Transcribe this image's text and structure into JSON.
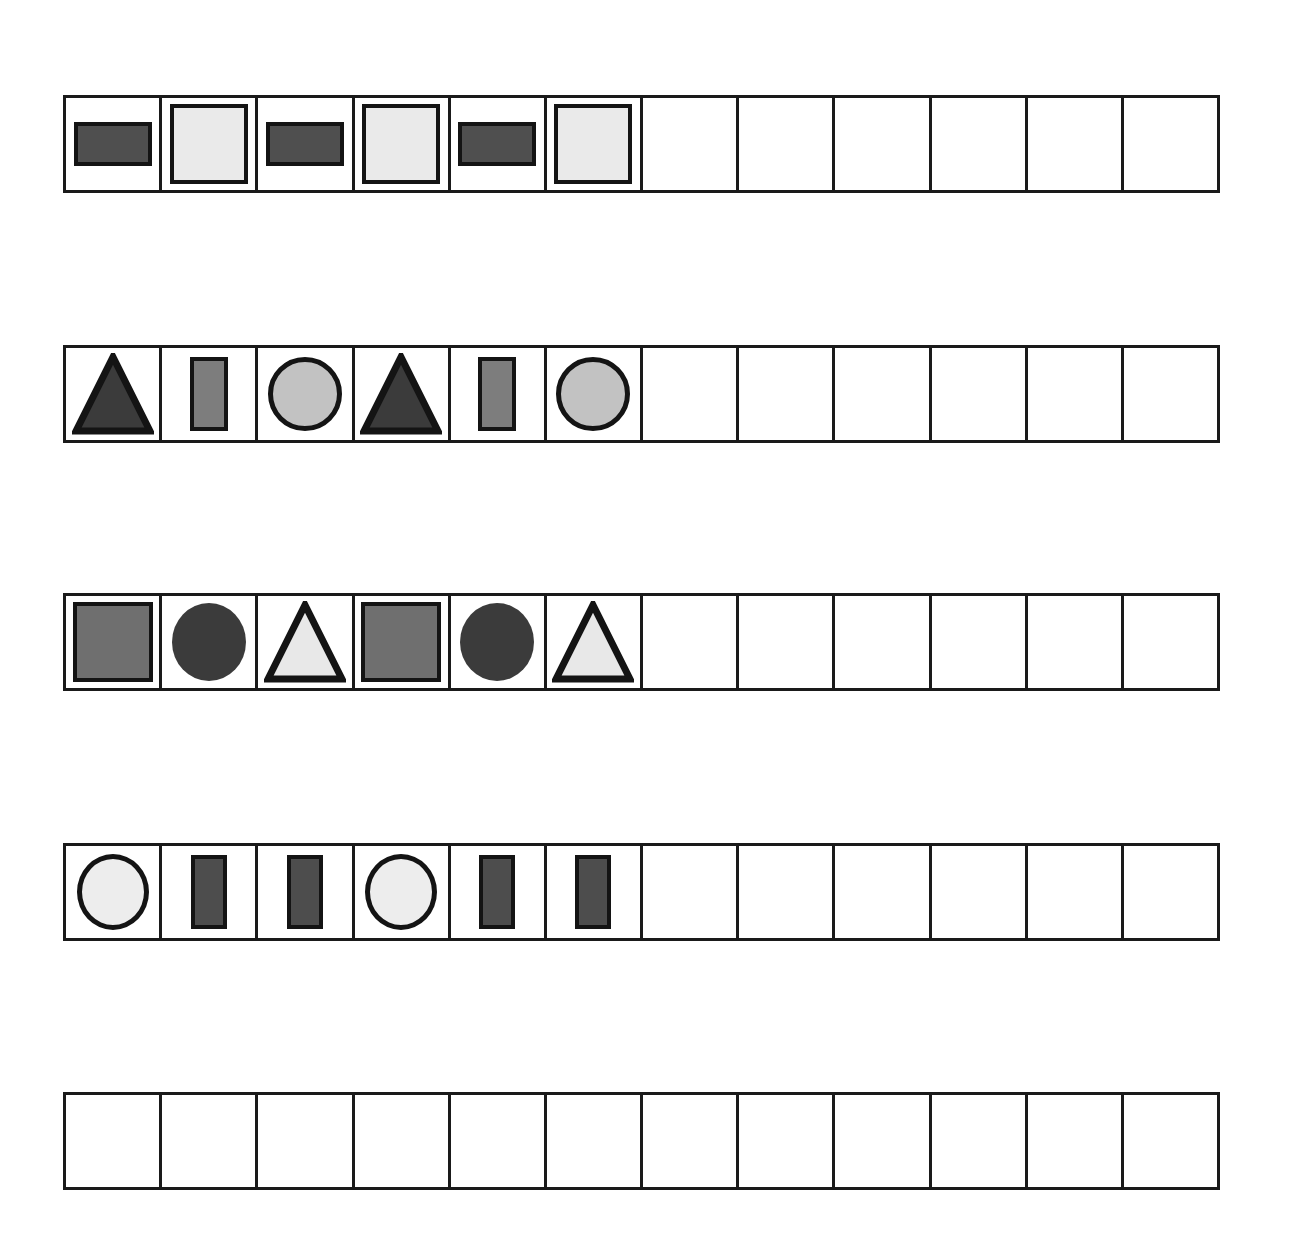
{
  "page": {
    "background_color": "#ffffff",
    "line_color": "#1a1a1a",
    "width": 1289,
    "height": 1240
  },
  "grid": {
    "rows": 5,
    "columns_per_row": 12,
    "row_left": 63,
    "row_width": 1157,
    "row_height": 98,
    "cell_width": 96,
    "border_width_px": 3
  },
  "palette": {
    "outline": "#141414",
    "dark_gray": "#4f4f4f",
    "darker_gray": "#3b3b3b",
    "medium_gray": "#7d7d7d",
    "mid_gray": "#6f6f6f",
    "light_gray": "#c2c2c2",
    "very_light_gray": "#eaeaea",
    "near_white": "#ededed",
    "pale_gray": "#e8e8e8"
  },
  "rows": [
    {
      "id": "row-1",
      "top": 95,
      "pattern_period": 2,
      "filled_cells": 6,
      "empty_cells": 6,
      "cells": [
        {
          "index": 1,
          "shape": "rectangle",
          "fill": "#4f4f4f",
          "orientation": "horizontal",
          "label": "dark-gray-wide-rectangle"
        },
        {
          "index": 2,
          "shape": "square",
          "fill": "#eaeaea",
          "orientation": "upright",
          "label": "light-gray-square"
        },
        {
          "index": 3,
          "shape": "rectangle",
          "fill": "#4f4f4f",
          "orientation": "horizontal",
          "label": "dark-gray-wide-rectangle"
        },
        {
          "index": 4,
          "shape": "square",
          "fill": "#eaeaea",
          "orientation": "upright",
          "label": "light-gray-square"
        },
        {
          "index": 5,
          "shape": "rectangle",
          "fill": "#4f4f4f",
          "orientation": "horizontal",
          "label": "dark-gray-wide-rectangle"
        },
        {
          "index": 6,
          "shape": "square",
          "fill": "#eaeaea",
          "orientation": "upright",
          "label": "light-gray-square"
        },
        {
          "index": 7,
          "shape": "empty",
          "fill": "#ffffff",
          "label": "empty-cell"
        },
        {
          "index": 8,
          "shape": "empty",
          "fill": "#ffffff",
          "label": "empty-cell"
        },
        {
          "index": 9,
          "shape": "empty",
          "fill": "#ffffff",
          "label": "empty-cell"
        },
        {
          "index": 10,
          "shape": "empty",
          "fill": "#ffffff",
          "label": "empty-cell"
        },
        {
          "index": 11,
          "shape": "empty",
          "fill": "#ffffff",
          "label": "empty-cell"
        },
        {
          "index": 12,
          "shape": "empty",
          "fill": "#ffffff",
          "label": "empty-cell"
        }
      ]
    },
    {
      "id": "row-2",
      "top": 345,
      "pattern_period": 3,
      "filled_cells": 6,
      "empty_cells": 6,
      "cells": [
        {
          "index": 1,
          "shape": "triangle",
          "fill": "#3b3b3b",
          "orientation": "upright",
          "label": "dark-gray-triangle"
        },
        {
          "index": 2,
          "shape": "rectangle",
          "fill": "#7d7d7d",
          "orientation": "vertical",
          "label": "medium-gray-tall-rectangle"
        },
        {
          "index": 3,
          "shape": "circle",
          "fill": "#c2c2c2",
          "orientation": "upright",
          "label": "light-gray-circle"
        },
        {
          "index": 4,
          "shape": "triangle",
          "fill": "#3b3b3b",
          "orientation": "upright",
          "label": "dark-gray-triangle"
        },
        {
          "index": 5,
          "shape": "rectangle",
          "fill": "#7d7d7d",
          "orientation": "vertical",
          "label": "medium-gray-tall-rectangle"
        },
        {
          "index": 6,
          "shape": "circle",
          "fill": "#c2c2c2",
          "orientation": "upright",
          "label": "light-gray-circle"
        },
        {
          "index": 7,
          "shape": "empty",
          "fill": "#ffffff",
          "label": "empty-cell"
        },
        {
          "index": 8,
          "shape": "empty",
          "fill": "#ffffff",
          "label": "empty-cell"
        },
        {
          "index": 9,
          "shape": "empty",
          "fill": "#ffffff",
          "label": "empty-cell"
        },
        {
          "index": 10,
          "shape": "empty",
          "fill": "#ffffff",
          "label": "empty-cell"
        },
        {
          "index": 11,
          "shape": "empty",
          "fill": "#ffffff",
          "label": "empty-cell"
        },
        {
          "index": 12,
          "shape": "empty",
          "fill": "#ffffff",
          "label": "empty-cell"
        }
      ]
    },
    {
      "id": "row-3",
      "top": 593,
      "pattern_period": 3,
      "filled_cells": 6,
      "empty_cells": 6,
      "cells": [
        {
          "index": 1,
          "shape": "square",
          "fill": "#6f6f6f",
          "orientation": "upright",
          "label": "gray-square"
        },
        {
          "index": 2,
          "shape": "circle",
          "fill": "#3b3b3b",
          "orientation": "upright",
          "label": "dark-gray-circle"
        },
        {
          "index": 3,
          "shape": "triangle",
          "fill": "#e8e8e8",
          "orientation": "upright",
          "label": "light-gray-triangle"
        },
        {
          "index": 4,
          "shape": "square",
          "fill": "#6f6f6f",
          "orientation": "upright",
          "label": "gray-square"
        },
        {
          "index": 5,
          "shape": "circle",
          "fill": "#3b3b3b",
          "orientation": "upright",
          "label": "dark-gray-circle"
        },
        {
          "index": 6,
          "shape": "triangle",
          "fill": "#e8e8e8",
          "orientation": "upright",
          "label": "light-gray-triangle"
        },
        {
          "index": 7,
          "shape": "empty",
          "fill": "#ffffff",
          "label": "empty-cell"
        },
        {
          "index": 8,
          "shape": "empty",
          "fill": "#ffffff",
          "label": "empty-cell"
        },
        {
          "index": 9,
          "shape": "empty",
          "fill": "#ffffff",
          "label": "empty-cell"
        },
        {
          "index": 10,
          "shape": "empty",
          "fill": "#ffffff",
          "label": "empty-cell"
        },
        {
          "index": 11,
          "shape": "empty",
          "fill": "#ffffff",
          "label": "empty-cell"
        },
        {
          "index": 12,
          "shape": "empty",
          "fill": "#ffffff",
          "label": "empty-cell"
        }
      ]
    },
    {
      "id": "row-4",
      "top": 843,
      "pattern_period": 3,
      "filled_cells": 6,
      "empty_cells": 6,
      "cells": [
        {
          "index": 1,
          "shape": "circle",
          "fill": "#ededed",
          "orientation": "upright",
          "label": "white-circle"
        },
        {
          "index": 2,
          "shape": "rectangle",
          "fill": "#4d4d4d",
          "orientation": "vertical",
          "label": "dark-gray-tall-rectangle"
        },
        {
          "index": 3,
          "shape": "rectangle",
          "fill": "#4d4d4d",
          "orientation": "vertical",
          "label": "dark-gray-tall-rectangle"
        },
        {
          "index": 4,
          "shape": "circle",
          "fill": "#ededed",
          "orientation": "upright",
          "label": "white-circle"
        },
        {
          "index": 5,
          "shape": "rectangle",
          "fill": "#4d4d4d",
          "orientation": "vertical",
          "label": "dark-gray-tall-rectangle"
        },
        {
          "index": 6,
          "shape": "rectangle",
          "fill": "#4d4d4d",
          "orientation": "vertical",
          "label": "dark-gray-tall-rectangle"
        },
        {
          "index": 7,
          "shape": "empty",
          "fill": "#ffffff",
          "label": "empty-cell"
        },
        {
          "index": 8,
          "shape": "empty",
          "fill": "#ffffff",
          "label": "empty-cell"
        },
        {
          "index": 9,
          "shape": "empty",
          "fill": "#ffffff",
          "label": "empty-cell"
        },
        {
          "index": 10,
          "shape": "empty",
          "fill": "#ffffff",
          "label": "empty-cell"
        },
        {
          "index": 11,
          "shape": "empty",
          "fill": "#ffffff",
          "label": "empty-cell"
        },
        {
          "index": 12,
          "shape": "empty",
          "fill": "#ffffff",
          "label": "empty-cell"
        }
      ]
    },
    {
      "id": "row-5",
      "top": 1092,
      "pattern_period": 0,
      "filled_cells": 0,
      "empty_cells": 12,
      "cells": [
        {
          "index": 1,
          "shape": "empty",
          "fill": "#ffffff",
          "label": "empty-cell"
        },
        {
          "index": 2,
          "shape": "empty",
          "fill": "#ffffff",
          "label": "empty-cell"
        },
        {
          "index": 3,
          "shape": "empty",
          "fill": "#ffffff",
          "label": "empty-cell"
        },
        {
          "index": 4,
          "shape": "empty",
          "fill": "#ffffff",
          "label": "empty-cell"
        },
        {
          "index": 5,
          "shape": "empty",
          "fill": "#ffffff",
          "label": "empty-cell"
        },
        {
          "index": 6,
          "shape": "empty",
          "fill": "#ffffff",
          "label": "empty-cell"
        },
        {
          "index": 7,
          "shape": "empty",
          "fill": "#ffffff",
          "label": "empty-cell"
        },
        {
          "index": 8,
          "shape": "empty",
          "fill": "#ffffff",
          "label": "empty-cell"
        },
        {
          "index": 9,
          "shape": "empty",
          "fill": "#ffffff",
          "label": "empty-cell"
        },
        {
          "index": 10,
          "shape": "empty",
          "fill": "#ffffff",
          "label": "empty-cell"
        },
        {
          "index": 11,
          "shape": "empty",
          "fill": "#ffffff",
          "label": "empty-cell"
        },
        {
          "index": 12,
          "shape": "empty",
          "fill": "#ffffff",
          "label": "empty-cell"
        }
      ]
    }
  ]
}
